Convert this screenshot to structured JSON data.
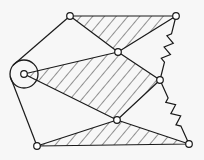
{
  "diagram": {
    "type": "mechanism-linkage",
    "stroke_color": "#1a1a1a",
    "background_color": "#f7f7f7",
    "hatch_color": "#2a2a2a",
    "nodes": [
      {
        "id": "A",
        "label": "pivot-left",
        "x": 24,
        "y": 74,
        "kind": "fixed-pivot",
        "outer_r": 14
      },
      {
        "id": "B",
        "label": "top-left",
        "x": 70,
        "y": 16
      },
      {
        "id": "C",
        "label": "top-right",
        "x": 176,
        "y": 16
      },
      {
        "id": "D",
        "label": "mid-upper",
        "x": 118,
        "y": 52
      },
      {
        "id": "E",
        "label": "right-mid",
        "x": 160,
        "y": 80
      },
      {
        "id": "F",
        "label": "lower-mid",
        "x": 117,
        "y": 120
      },
      {
        "id": "G",
        "label": "bottom-left",
        "x": 37,
        "y": 146
      },
      {
        "id": "H",
        "label": "bottom-right",
        "x": 189,
        "y": 144
      }
    ],
    "rigid_bodies": [
      {
        "name": "top-triangle",
        "vertices": [
          "B",
          "C",
          "D"
        ],
        "hatched": true
      },
      {
        "name": "middle-quad",
        "vertices": [
          "A",
          "D",
          "E",
          "F"
        ],
        "hatched": true
      },
      {
        "name": "bottom-triangle",
        "vertices": [
          "G",
          "F",
          "H"
        ],
        "hatched": true
      }
    ],
    "links": [
      {
        "from": "A",
        "to": "B",
        "kind": "bar"
      },
      {
        "from": "A",
        "to": "G",
        "kind": "bar"
      }
    ],
    "springs": [
      {
        "from": "C",
        "to": "E",
        "kind": "zigzag"
      },
      {
        "from": "E",
        "to": "H",
        "kind": "zigzag"
      }
    ]
  }
}
